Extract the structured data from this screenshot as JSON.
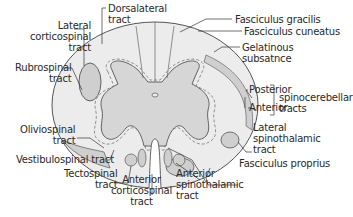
{
  "diagram": {
    "colors": {
      "white_matter": "#ececec",
      "gray_matter": "#d6d6d6",
      "outline": "#555555",
      "tract_fill": "#cfcfcf",
      "label_text": "#2a2a2a"
    },
    "labels": {
      "lateral_corticospinal": [
        "Lateral",
        "corticospinal",
        "tract"
      ],
      "dorsolateral": [
        "Dorsalateral",
        "tract"
      ],
      "fasciculus_gracilis": "Fasciculus gracilis",
      "fasciculus_cuneatus": "Fasciculus cuneatus",
      "gelatinous": [
        "Gelatinous",
        "subsatnce"
      ],
      "rubrospinal": [
        "Rubrospinal",
        "tract"
      ],
      "posterior": "Posterior",
      "anterior": "Anterior",
      "spinocerebellar": [
        "spinocerebellar",
        "tracts"
      ],
      "lateral_spinothalamic": [
        "Lateral",
        "spinothalamic",
        "tract"
      ],
      "oliviospinal": [
        "Oliviospinal",
        "tract"
      ],
      "vestibulospinal": "Vestibulospinal tract",
      "tectospinal": [
        "Tectospinal",
        "tract"
      ],
      "anterior_corticospinal": [
        "Anterior",
        "corticospinal",
        "tract"
      ],
      "anterior_spinothalamic": [
        "Anterior",
        "spinothalamic",
        "tract"
      ],
      "fasciculus_proprius": "Fasciculus proprius"
    }
  }
}
